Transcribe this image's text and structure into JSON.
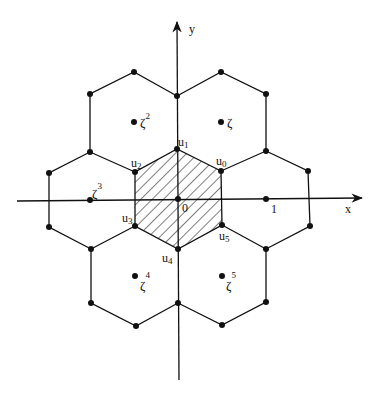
{
  "diagram": {
    "type": "hexagonal-lattice",
    "axes": {
      "x_label": "x",
      "y_label": "y",
      "origin_label": "0",
      "unit_label": "1"
    },
    "shaded_region_vertices": [
      {
        "name": "u0",
        "base": "u",
        "sub": "0"
      },
      {
        "name": "u1",
        "base": "u",
        "sub": "1"
      },
      {
        "name": "u2",
        "base": "u",
        "sub": "2"
      },
      {
        "name": "u3",
        "base": "u",
        "sub": "3"
      },
      {
        "name": "u4",
        "base": "u",
        "sub": "4"
      },
      {
        "name": "u5",
        "base": "u",
        "sub": "5"
      }
    ],
    "lattice_points": [
      {
        "name": "zeta",
        "base": "ζ",
        "sup": ""
      },
      {
        "name": "zeta2",
        "base": "ζ",
        "sup": "2"
      },
      {
        "name": "zeta3",
        "base": "ζ",
        "sup": "3"
      },
      {
        "name": "zeta4",
        "base": "ζ",
        "sup": "4"
      },
      {
        "name": "zeta5",
        "base": "ζ",
        "sup": "5"
      }
    ],
    "colors": {
      "line": "#111111",
      "background": "#ffffff"
    }
  }
}
